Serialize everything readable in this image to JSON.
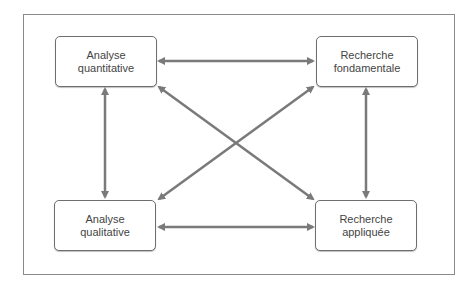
{
  "nodes": {
    "top_left": {
      "line1": "Analyse",
      "line2": "quantitative"
    },
    "top_right": {
      "line1": "Recherche",
      "line2": "fondamentale"
    },
    "bottom_left": {
      "line1": "Analyse",
      "line2": "qualitative"
    },
    "bottom_right": {
      "line1": "Recherche",
      "line2": "appliquée"
    }
  },
  "colors": {
    "arrow": "#7a7a7a",
    "border": "#6e6e6e",
    "text": "#444444"
  },
  "edges": [
    {
      "from": "top_left",
      "to": "top_right",
      "type": "bidirectional"
    },
    {
      "from": "bottom_left",
      "to": "bottom_right",
      "type": "bidirectional"
    },
    {
      "from": "top_left",
      "to": "bottom_left",
      "type": "bidirectional"
    },
    {
      "from": "top_right",
      "to": "bottom_right",
      "type": "bidirectional"
    },
    {
      "from": "top_left",
      "to": "bottom_right",
      "type": "bidirectional"
    },
    {
      "from": "top_right",
      "to": "bottom_left",
      "type": "bidirectional"
    }
  ]
}
